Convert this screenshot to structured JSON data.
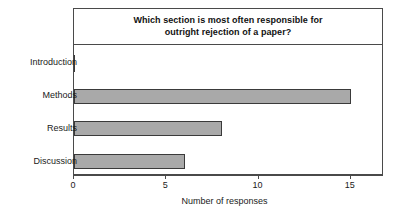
{
  "chart_data": {
    "type": "bar",
    "orientation": "horizontal",
    "title": "Which section is most often responsible for outright rejection of a paper?",
    "title_line1": "Which section is most often responsible for",
    "title_line2": "outright rejection of a paper?",
    "categories": [
      "Introduction",
      "Methods",
      "Results",
      "Discussion"
    ],
    "values": [
      0,
      15,
      8,
      6
    ],
    "xlabel": "Number of responses",
    "ylabel": "",
    "xlim": [
      0,
      16.8
    ],
    "xticks": [
      0,
      5,
      10,
      15
    ],
    "xtick_labels": [
      "0",
      "5",
      "10",
      "15"
    ],
    "grid": false,
    "legend": false,
    "bar_fill_color": "#a9a9a9",
    "bar_edge_color": "#3a3a3a",
    "frame_color": "#4a4a4a",
    "background_color": "#ffffff"
  }
}
